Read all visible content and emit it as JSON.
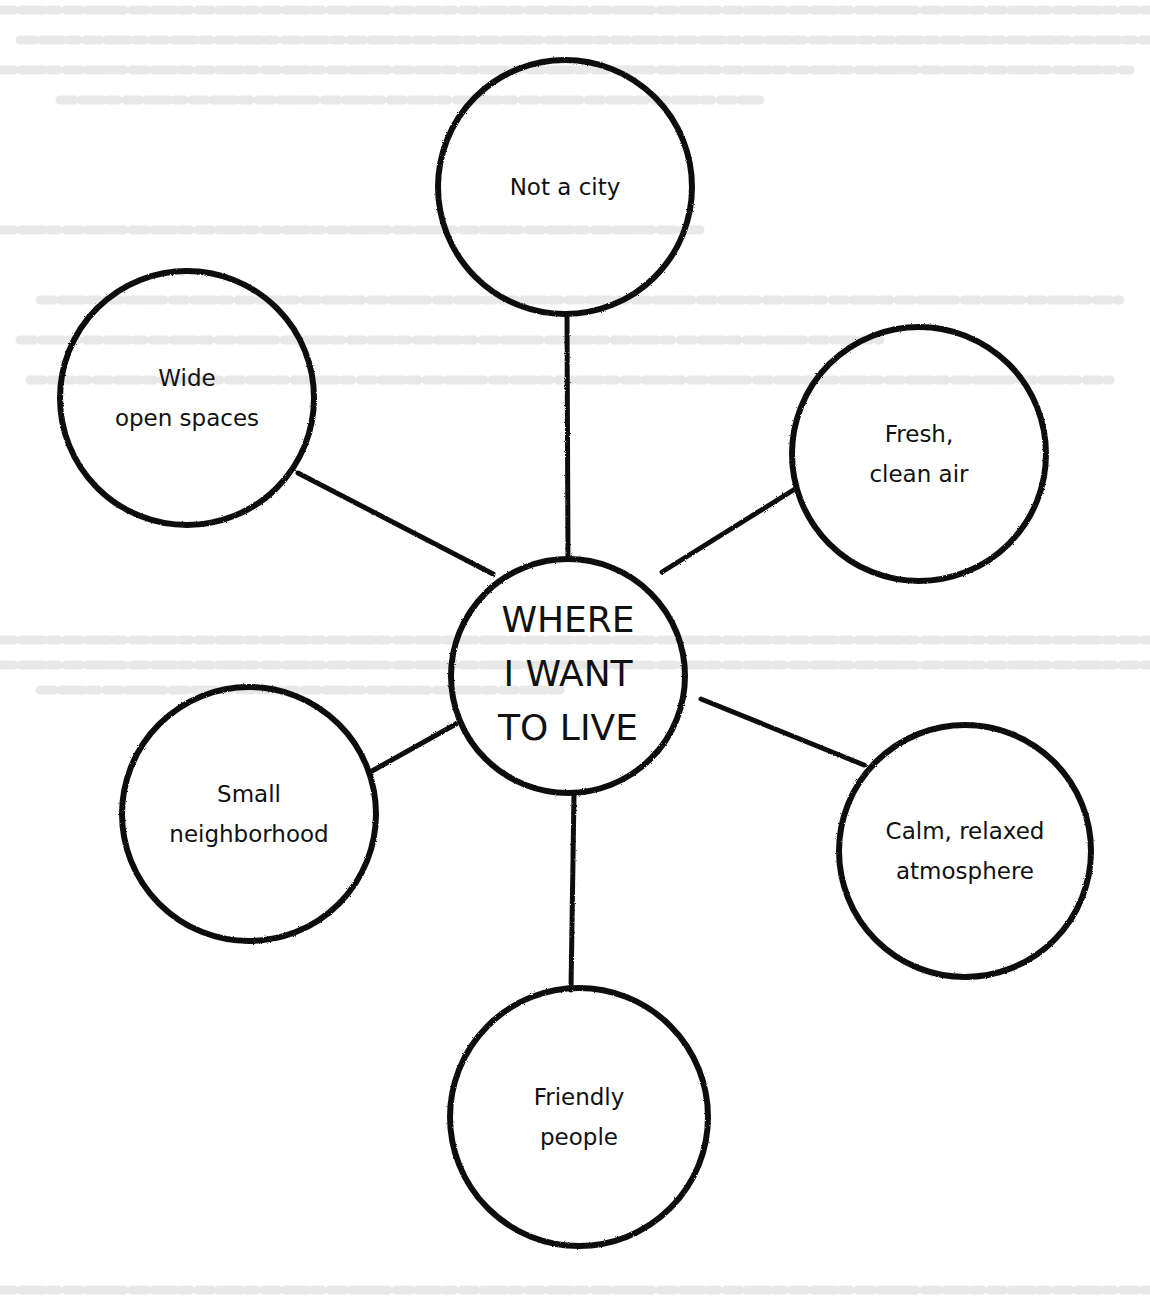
{
  "diagram": {
    "type": "mind-map",
    "colors": {
      "ink": "#111111",
      "paper": "#ffffff",
      "bleed_through": "#e4e4e4"
    },
    "center": {
      "lines": [
        "WHERE",
        "I WANT",
        "TO LIVE"
      ],
      "cx": 568,
      "cy": 676,
      "r": 117
    },
    "nodes": [
      {
        "id": "not-a-city",
        "lines": [
          "Not a city"
        ],
        "cx": 565,
        "cy": 187,
        "r": 127,
        "line_from": [
          568,
          558
        ],
        "line_to": [
          567,
          314
        ]
      },
      {
        "id": "wide-open-spaces",
        "lines": [
          "Wide",
          "open spaces"
        ],
        "cx": 187,
        "cy": 398,
        "r": 127,
        "line_from": [
          493,
          574
        ],
        "line_to": [
          298,
          473
        ]
      },
      {
        "id": "fresh-clean-air",
        "lines": [
          "Fresh,",
          "clean air"
        ],
        "cx": 919,
        "cy": 454,
        "r": 127,
        "line_from": [
          662,
          572
        ],
        "line_to": [
          795,
          489
        ]
      },
      {
        "id": "small-neighborhood",
        "lines": [
          "Small",
          "neighborhood"
        ],
        "cx": 249,
        "cy": 814,
        "r": 127,
        "line_from": [
          456,
          724
        ],
        "line_to": [
          372,
          771
        ]
      },
      {
        "id": "calm-relaxed-atmosphere",
        "lines": [
          "Calm, relaxed",
          "atmosphere"
        ],
        "cx": 965,
        "cy": 851,
        "r": 126,
        "line_from": [
          701,
          699
        ],
        "line_to": [
          864,
          765
        ]
      },
      {
        "id": "friendly-people",
        "lines": [
          "Friendly",
          "people"
        ],
        "cx": 579,
        "cy": 1117,
        "r": 129,
        "line_from": [
          574,
          794
        ],
        "line_to": [
          571,
          990
        ]
      }
    ]
  }
}
